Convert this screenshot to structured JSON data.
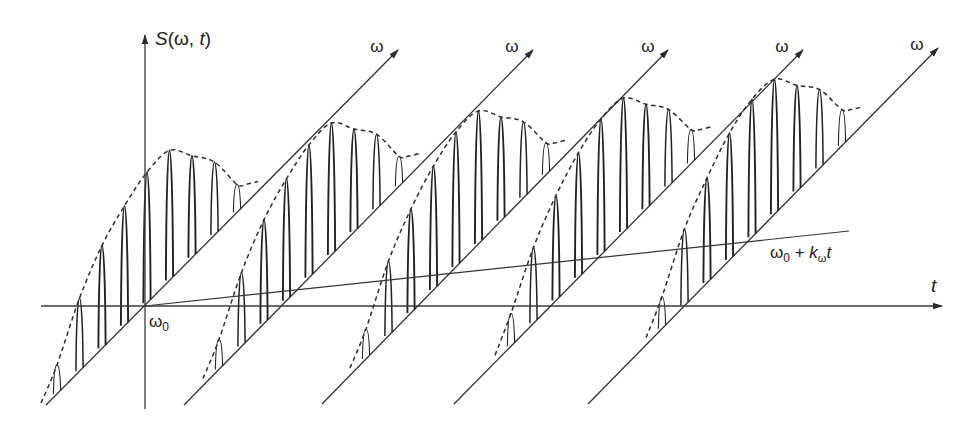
{
  "figure": {
    "colors": {
      "ink": "#222222",
      "axis": "#3a3a3a",
      "background": "#ffffff"
    },
    "labels": {
      "vertical_axis": {
        "text": "S(ω, t)",
        "parts": [
          "S",
          "(ω, ",
          "t",
          ")"
        ],
        "x": 155,
        "y": 45
      },
      "time_axis": {
        "text": "t",
        "x": 931,
        "y": 292
      },
      "origin": {
        "text": "ω0",
        "base": "ω",
        "sub": "0",
        "x": 149,
        "y": 327
      },
      "sweep_line": {
        "text": "ω0 + kωt",
        "base": "ω",
        "sub0": "0",
        "plus": " + ",
        "k": "k",
        "subk": "ω",
        "t": "t",
        "x": 770,
        "y": 258
      },
      "freq_axis": "ω"
    },
    "axes": {
      "vertical": {
        "x": 145,
        "y_bottom": 409,
        "y_top": 35
      },
      "time": {
        "y": 306,
        "x_start": 41,
        "x_end": 942
      }
    },
    "sweep_line": {
      "x1": 145,
      "y1": 306,
      "x2": 849,
      "y2": 231
    },
    "peak_spacing": 22.5,
    "peak_half_width": 3.6,
    "slices": [
      {
        "id": 1,
        "diag_start": [
          46,
          405
        ],
        "diag_end": [
          398,
          50
        ],
        "omega_label": [
          377,
          52
        ],
        "first_offset": 11,
        "heights": [
          29,
          73,
          103,
          120,
          131,
          130,
          102,
          73,
          28
        ]
      },
      {
        "id": 2,
        "diag_start": [
          184,
          405
        ],
        "diag_end": [
          533,
          50
        ],
        "omega_label": [
          512,
          52
        ],
        "first_offset": 35,
        "heights": [
          30,
          74,
          104,
          122,
          133,
          132,
          103,
          75,
          30
        ]
      },
      {
        "id": 3,
        "diag_start": [
          322,
          404
        ],
        "diag_end": [
          668,
          50
        ],
        "omega_label": [
          648,
          52
        ],
        "first_offset": 44,
        "heights": [
          30,
          75,
          104,
          124,
          135,
          133,
          104,
          76,
          32
        ]
      },
      {
        "id": 4,
        "diag_start": [
          454,
          404
        ],
        "diag_end": [
          803,
          50
        ],
        "omega_label": [
          782,
          52
        ],
        "first_offset": 57,
        "heights": [
          33,
          76,
          105,
          125,
          136,
          134,
          105,
          77,
          34
        ]
      },
      {
        "id": 5,
        "diag_start": [
          588,
          404
        ],
        "diag_end": [
          938,
          48
        ],
        "omega_label": [
          917,
          50
        ],
        "first_offset": 74,
        "heights": [
          32,
          77,
          105,
          127,
          138,
          135,
          106,
          79,
          36
        ]
      }
    ]
  },
  "chart_data": {
    "type": "waterfall",
    "title": "S(ω, t)",
    "xlabel": "t",
    "ylabel": "S(ω, t)",
    "zlabel": "ω",
    "annotations": [
      "ω0",
      "ω0 + kωt"
    ],
    "slices": 5,
    "peaks_per_slice": 9,
    "relative_peak_heights": [
      0.22,
      0.55,
      0.77,
      0.91,
      1.0,
      0.98,
      0.77,
      0.56,
      0.24
    ]
  }
}
